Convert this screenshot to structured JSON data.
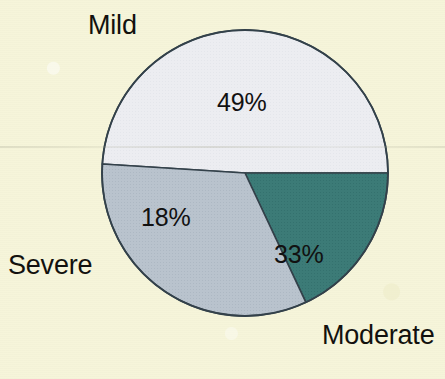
{
  "chart_data": {
    "type": "pie",
    "title": "",
    "subtitle": "",
    "xlabel": "",
    "ylabel": "",
    "legend_position": "outside-labels",
    "grid": false,
    "categories": [
      "Mild",
      "Moderate",
      "Severe"
    ],
    "values": [
      49,
      33,
      18
    ],
    "value_unit": "%",
    "slices": [
      {
        "label": "Mild",
        "value": 49,
        "value_label": "49%",
        "color": "#ecedf1",
        "start_angle_deg": 0,
        "end_angle_deg": 176.4
      },
      {
        "label": "Moderate",
        "value": 33,
        "value_label": "33%",
        "color": "#b9c3cd",
        "start_angle_deg": 241.2,
        "end_angle_deg": 360
      },
      {
        "label": "Severe",
        "value": 18,
        "value_label": "18%",
        "color": "#3c7b77",
        "start_angle_deg": 176.4,
        "end_angle_deg": 241.2
      }
    ]
  },
  "colors": {
    "background": "#f6f5da",
    "slice_mild": "#ecedf1",
    "slice_moderate": "#b9c3cd",
    "slice_severe": "#3c7b77",
    "outline": "#33414a",
    "label_text": "#12110e"
  },
  "labels": {
    "mild": "Mild",
    "moderate": "Moderate",
    "severe": "Severe"
  },
  "percent_labels": {
    "mild": "49%",
    "moderate": "33%",
    "severe": "18%"
  }
}
